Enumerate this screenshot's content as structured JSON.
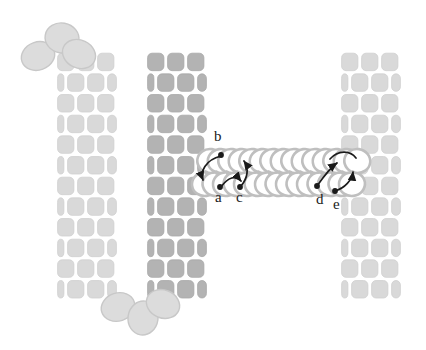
{
  "figure": {
    "type": "schematic-diagram",
    "background_color": "#ffffff",
    "width": 426,
    "height": 350
  },
  "colors": {
    "wall_light": "#d9d9d9",
    "wall_light_stroke": "#cfcfcf",
    "wall_dark": "#b3b3b3",
    "wall_dark_stroke": "#a8a8a8",
    "subunit_fill": "#dcdcdc",
    "subunit_stroke": "#c8c8c8",
    "chain_fill": "#ffffff",
    "chain_stroke": "#bfbfbf",
    "arrow_color": "#1a1a1a",
    "label_color": "#1a1a1a"
  },
  "walls": [
    {
      "id": "left-wall",
      "name": "left-wall",
      "shade": "light",
      "x": 57,
      "y": 52,
      "width": 60,
      "height": 248,
      "columns": 3,
      "rows": 12
    },
    {
      "id": "middle-wall",
      "name": "middle-wall",
      "shade": "dark",
      "x": 147,
      "y": 52,
      "width": 60,
      "height": 248,
      "columns": 3,
      "rows": 12
    },
    {
      "id": "right-wall",
      "name": "right-wall",
      "shade": "light",
      "x": 341,
      "y": 52,
      "width": 60,
      "height": 248,
      "columns": 3,
      "rows": 12
    }
  ],
  "free_subunits": {
    "top_cluster": [
      {
        "cx": 38,
        "cy": 56,
        "rx": 17,
        "ry": 14,
        "rotate": -20
      },
      {
        "cx": 62,
        "cy": 38,
        "rx": 17,
        "ry": 15,
        "rotate": 10
      },
      {
        "cx": 79,
        "cy": 54,
        "rx": 17,
        "ry": 14,
        "rotate": 25
      }
    ],
    "bottom_cluster": [
      {
        "cx": 118,
        "cy": 307,
        "rx": 17,
        "ry": 14,
        "rotate": -18
      },
      {
        "cx": 143,
        "cy": 318,
        "rx": 15,
        "ry": 17,
        "rotate": 8
      },
      {
        "cx": 163,
        "cy": 304,
        "rx": 17,
        "ry": 14,
        "rotate": 22
      }
    ]
  },
  "chain": {
    "name": "interlocking-ring-chain",
    "start_x": 205,
    "end_x": 352,
    "top_row_cy": 161,
    "bottom_row_cy": 184,
    "link_count": 14,
    "link_rx": 13,
    "link_ry": 12
  },
  "labels": [
    {
      "id": "a",
      "text": "a",
      "x": 215,
      "y": 194,
      "dot_x": 220,
      "dot_y": 187
    },
    {
      "id": "b",
      "text": "b",
      "x": 214,
      "y": 136,
      "dot_x": 221,
      "dot_y": 155
    },
    {
      "id": "c",
      "text": "c",
      "x": 236,
      "y": 194,
      "dot_x": 240,
      "dot_y": 187
    },
    {
      "id": "d",
      "text": "d",
      "x": 316,
      "y": 195,
      "dot_x": 317,
      "dot_y": 187
    },
    {
      "id": "e",
      "text": "e",
      "x": 333,
      "y": 200,
      "dot_x": 335,
      "dot_y": 192
    }
  ],
  "arrows": [
    {
      "id": "arrow-b-to-a",
      "from": "b",
      "to": "a",
      "style": "curved"
    },
    {
      "id": "arrow-a-to-c",
      "from": "a",
      "to": "c",
      "style": "curved"
    },
    {
      "id": "arrow-c-up",
      "from": "c",
      "to": "chain-top",
      "style": "curved"
    },
    {
      "id": "arrow-d-right",
      "from": "d",
      "to": "chain-right-top",
      "style": "curved"
    },
    {
      "id": "arrow-e-in",
      "from": "e",
      "to": "chain-right",
      "style": "curved"
    }
  ]
}
